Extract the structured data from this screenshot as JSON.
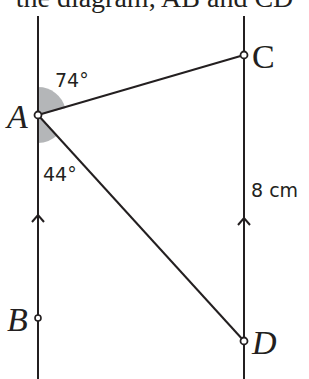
{
  "header": {
    "clipped_text": "the diagram, AB and CD"
  },
  "diagram": {
    "points": {
      "A": {
        "label": "A",
        "x": 38,
        "y": 115
      },
      "B": {
        "label": "B",
        "x": 38,
        "y": 318
      },
      "C": {
        "label": "C",
        "x": 244,
        "y": 55
      },
      "D": {
        "label": "D",
        "x": 244,
        "y": 341
      }
    },
    "angles": {
      "upper": "74°",
      "lower": "44°"
    },
    "length_label": "8 cm",
    "colors": {
      "line": "#231f20",
      "shade": "#a7a9ac"
    }
  }
}
